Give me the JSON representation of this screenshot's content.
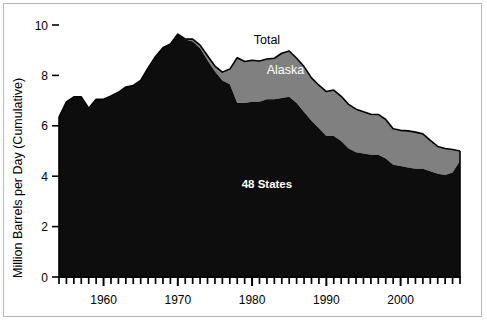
{
  "figure": {
    "background_color": "#ffffff",
    "border_color": "#b9b9b9"
  },
  "chart_data": {
    "type": "area",
    "stacked": true,
    "title": "",
    "xlabel": "",
    "ylabel": "Million Barrels per Day (Cumulative)",
    "xlim": [
      1954,
      2008
    ],
    "ylim": [
      0,
      10
    ],
    "grid": false,
    "legend_position": "inline-annotations",
    "x_tick_labels": [
      "1960",
      "1970",
      "1980",
      "1990",
      "2000"
    ],
    "x_tick_values": [
      1960,
      1970,
      1980,
      1990,
      2000
    ],
    "x_minor_tick_interval": 1,
    "y_tick_labels": [
      "0",
      "2",
      "4",
      "6",
      "8",
      "10"
    ],
    "y_tick_values": [
      0,
      2,
      4,
      6,
      8,
      10
    ],
    "colors": {
      "48_states": "#0d0d0d",
      "alaska": "#808080",
      "outline": "#000000"
    },
    "x": [
      1954,
      1955,
      1956,
      1957,
      1958,
      1959,
      1960,
      1961,
      1962,
      1963,
      1964,
      1965,
      1966,
      1967,
      1968,
      1969,
      1970,
      1971,
      1972,
      1973,
      1974,
      1975,
      1976,
      1977,
      1978,
      1979,
      1980,
      1981,
      1982,
      1983,
      1984,
      1985,
      1986,
      1987,
      1988,
      1989,
      1990,
      1991,
      1992,
      1993,
      1994,
      1995,
      1996,
      1997,
      1998,
      1999,
      2000,
      2001,
      2002,
      2003,
      2004,
      2005,
      2006,
      2007,
      2008
    ],
    "series": [
      {
        "name": "48 States",
        "label": "48 States",
        "color": "#0d0d0d",
        "values": [
          6.35,
          6.95,
          7.15,
          7.15,
          6.7,
          7.05,
          7.05,
          7.18,
          7.33,
          7.54,
          7.6,
          7.8,
          8.3,
          8.75,
          9.1,
          9.25,
          9.64,
          9.45,
          9.44,
          9.2,
          8.78,
          8.37,
          8.13,
          8.25,
          8.7,
          8.55,
          8.6,
          8.57,
          8.65,
          8.68,
          8.88,
          8.97,
          8.68,
          8.35,
          7.9,
          7.61,
          7.36,
          7.42,
          7.17,
          6.85,
          6.66,
          6.56,
          6.46,
          6.45,
          6.25,
          5.88,
          5.82,
          5.8,
          5.75,
          5.68,
          5.42,
          5.18,
          5.1,
          5.06,
          5.0
        ],
        "note": "Lower band (48 contiguous states)",
        "data_48_states": [
          6.35,
          6.95,
          7.15,
          7.15,
          6.7,
          7.05,
          7.05,
          7.18,
          7.33,
          7.54,
          7.6,
          7.8,
          8.3,
          8.75,
          9.1,
          9.25,
          9.64,
          9.42,
          9.35,
          9.08,
          8.6,
          8.15,
          7.8,
          7.65,
          6.9,
          6.9,
          6.95,
          6.95,
          7.05,
          7.05,
          7.1,
          7.15,
          6.9,
          6.55,
          6.2,
          5.9,
          5.6,
          5.6,
          5.4,
          5.1,
          4.95,
          4.9,
          4.85,
          4.85,
          4.7,
          4.45,
          4.4,
          4.35,
          4.3,
          4.3,
          4.2,
          4.1,
          4.05,
          4.15,
          4.6
        ]
      },
      {
        "name": "Alaska",
        "label": "Alaska",
        "color": "#808080",
        "note": "Upper band, difference between Total and 48 States",
        "values": [
          0.0,
          0.0,
          0.0,
          0.0,
          0.0,
          0.0,
          0.0,
          0.0,
          0.0,
          0.0,
          0.0,
          0.0,
          0.0,
          0.0,
          0.0,
          0.0,
          0.0,
          0.03,
          0.09,
          0.12,
          0.18,
          0.22,
          0.33,
          0.6,
          1.8,
          1.65,
          1.65,
          1.62,
          1.6,
          1.63,
          1.78,
          1.82,
          1.78,
          1.8,
          1.7,
          1.71,
          1.76,
          1.82,
          1.77,
          1.75,
          1.71,
          1.66,
          1.61,
          1.6,
          1.55,
          1.43,
          1.42,
          1.45,
          1.45,
          1.38,
          1.22,
          1.08,
          1.05,
          0.91,
          0.4
        ]
      }
    ],
    "total_label": "Total",
    "total_values": [
      6.35,
      6.95,
      7.15,
      7.15,
      6.7,
      7.05,
      7.05,
      7.18,
      7.33,
      7.54,
      7.6,
      7.8,
      8.3,
      8.75,
      9.1,
      9.25,
      9.64,
      9.45,
      9.44,
      9.2,
      8.78,
      8.37,
      8.13,
      8.25,
      8.7,
      8.55,
      8.6,
      8.57,
      8.65,
      8.68,
      8.88,
      8.97,
      8.68,
      8.35,
      7.9,
      7.61,
      7.36,
      7.42,
      7.17,
      6.85,
      6.66,
      6.56,
      6.46,
      6.45,
      6.25,
      5.88,
      5.82,
      5.8,
      5.75,
      5.68,
      5.42,
      5.18,
      5.1,
      5.06,
      5.0
    ],
    "annotations": [
      {
        "text": "Total",
        "x": 1982.0,
        "y": 9.25,
        "color": "#000000",
        "bold": false
      },
      {
        "text": "Alaska",
        "x": 1984.5,
        "y": 8.05,
        "color": "#ffffff",
        "bold": false
      },
      {
        "text": "48 States",
        "x": 1982.0,
        "y": 3.55,
        "color": "#ffffff",
        "bold": true
      }
    ]
  }
}
